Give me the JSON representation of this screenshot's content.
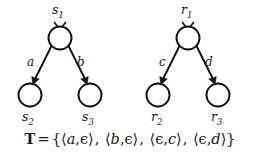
{
  "figure": {
    "background_color": "#ffffff",
    "ink_color": "#111111"
  },
  "trees": [
    {
      "id": "s-tree",
      "root": {
        "label": "s",
        "subscript": "1"
      },
      "children": [
        {
          "label": "s",
          "subscript": "2",
          "edge_label": "a"
        },
        {
          "label": "s",
          "subscript": "3",
          "edge_label": "b"
        }
      ]
    },
    {
      "id": "r-tree",
      "root": {
        "label": "r",
        "subscript": "1"
      },
      "children": [
        {
          "label": "r",
          "subscript": "2",
          "edge_label": "c"
        },
        {
          "label": "r",
          "subscript": "3",
          "edge_label": "d"
        }
      ]
    }
  ],
  "formula": {
    "name": "T",
    "operator": "=",
    "open_brace": "{",
    "close_brace": "}",
    "separator": ",",
    "open_angle": "⟨",
    "close_angle": "⟩",
    "inner_comma": ",",
    "epsilon": "ϵ",
    "pairs": [
      {
        "left": "a",
        "right": "ϵ",
        "left_is_epsilon": false,
        "right_is_epsilon": true
      },
      {
        "left": "b",
        "right": "ϵ",
        "left_is_epsilon": false,
        "right_is_epsilon": true
      },
      {
        "left": "ϵ",
        "right": "c",
        "left_is_epsilon": true,
        "right_is_epsilon": false
      },
      {
        "left": "ϵ",
        "right": "d",
        "left_is_epsilon": true,
        "right_is_epsilon": false
      }
    ]
  }
}
